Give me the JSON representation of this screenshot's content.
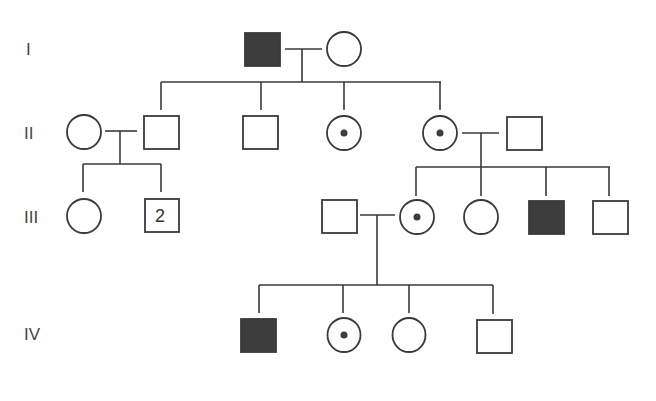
{
  "diagram": {
    "type": "pedigree-chart",
    "colors": {
      "line": "#3a3a3a",
      "affected_fill": "#3d3d3d",
      "background": "#ffffff"
    },
    "legend_semantics": {
      "filled_square": "affected male",
      "open_square": "unaffected male",
      "open_circle": "unaffected female",
      "circle_with_dot": "carrier female"
    },
    "generations": [
      {
        "label": "I"
      },
      {
        "label": "II"
      },
      {
        "label": "III"
      },
      {
        "label": "IV"
      }
    ],
    "individuals": {
      "I-1": {
        "sex": "male",
        "status": "affected"
      },
      "I-2": {
        "sex": "female",
        "status": "unaffected"
      },
      "II-1": {
        "sex": "female",
        "status": "unaffected",
        "note": "married in"
      },
      "II-2": {
        "sex": "male",
        "status": "unaffected"
      },
      "II-3": {
        "sex": "male",
        "status": "unaffected"
      },
      "II-4": {
        "sex": "female",
        "status": "carrier"
      },
      "II-5": {
        "sex": "female",
        "status": "carrier"
      },
      "II-6": {
        "sex": "male",
        "status": "unaffected",
        "note": "married in"
      },
      "III-1": {
        "sex": "female",
        "status": "unaffected"
      },
      "III-2": {
        "sex": "male",
        "status": "unaffected",
        "count": "2"
      },
      "III-3": {
        "sex": "male",
        "status": "unaffected",
        "note": "married in"
      },
      "III-4": {
        "sex": "female",
        "status": "carrier"
      },
      "III-5": {
        "sex": "female",
        "status": "unaffected"
      },
      "III-6": {
        "sex": "male",
        "status": "affected"
      },
      "III-7": {
        "sex": "male",
        "status": "unaffected"
      },
      "IV-1": {
        "sex": "male",
        "status": "affected"
      },
      "IV-2": {
        "sex": "female",
        "status": "carrier"
      },
      "IV-3": {
        "sex": "female",
        "status": "unaffected"
      },
      "IV-4": {
        "sex": "male",
        "status": "unaffected"
      }
    },
    "matings": [
      {
        "partners": [
          "I-1",
          "I-2"
        ],
        "children": [
          "II-2",
          "II-3",
          "II-4",
          "II-5"
        ]
      },
      {
        "partners": [
          "II-1",
          "II-2"
        ],
        "children": [
          "III-1",
          "III-2"
        ]
      },
      {
        "partners": [
          "II-5",
          "II-6"
        ],
        "children": [
          "III-4",
          "III-5",
          "III-6",
          "III-7"
        ]
      },
      {
        "partners": [
          "III-3",
          "III-4"
        ],
        "children": [
          "IV-1",
          "IV-2",
          "IV-3",
          "IV-4"
        ]
      }
    ]
  }
}
